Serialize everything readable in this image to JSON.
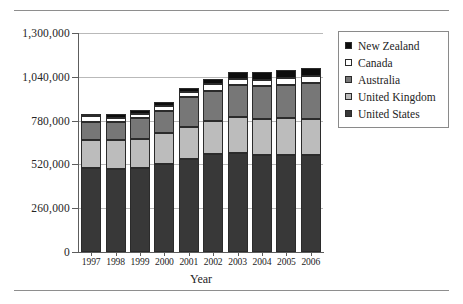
{
  "chart_data": {
    "type": "bar",
    "stacked": true,
    "title": "",
    "xlabel": "Year",
    "ylabel": "",
    "categories": [
      "1997",
      "1998",
      "1999",
      "2000",
      "2001",
      "2002",
      "2003",
      "2004",
      "2005",
      "2006"
    ],
    "ylim": [
      0,
      1300000
    ],
    "yticks": [
      0,
      260000,
      520000,
      780000,
      1040000,
      1300000
    ],
    "ytick_labels": [
      "0",
      "260,000",
      "520,000",
      "780,000",
      "1,040,000",
      "1,300,000"
    ],
    "grid": true,
    "legend_position": "right",
    "series": [
      {
        "name": "United States",
        "color": "#383838",
        "values": [
          500000,
          490000,
          500000,
          520000,
          550000,
          580000,
          585000,
          575000,
          575000,
          575000
        ]
      },
      {
        "name": "United Kingdom",
        "color": "#bcbcbc",
        "values": [
          165000,
          175000,
          170000,
          185000,
          195000,
          200000,
          215000,
          215000,
          220000,
          215000
        ]
      },
      {
        "name": "Australia",
        "color": "#777777",
        "values": [
          105000,
          105000,
          125000,
          135000,
          175000,
          175000,
          190000,
          195000,
          195000,
          215000
        ]
      },
      {
        "name": "Canada",
        "color": "#ffffff",
        "values": [
          37000,
          25000,
          25000,
          28000,
          28000,
          45000,
          38000,
          38000,
          43000,
          40000
        ]
      },
      {
        "name": "New Zealand",
        "color": "#0d0d0d",
        "values": [
          13000,
          25000,
          25000,
          25000,
          28000,
          28000,
          40000,
          45000,
          45000,
          50000
        ]
      }
    ],
    "totals": [
      820000,
      820000,
      845000,
      893000,
      976000,
      1028000,
      1068000,
      1068000,
      1078000,
      1095000
    ]
  },
  "legend": {
    "items": [
      {
        "label": "New Zealand",
        "swatch": "nz"
      },
      {
        "label": "Canada",
        "swatch": "ca"
      },
      {
        "label": "Australia",
        "swatch": "au"
      },
      {
        "label": "United Kingdom",
        "swatch": "uk"
      },
      {
        "label": "United States",
        "swatch": "us"
      }
    ]
  }
}
